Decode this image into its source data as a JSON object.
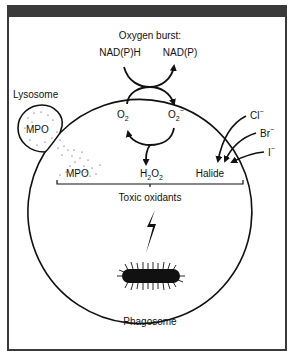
{
  "diagram": {
    "title": "Oxygen burst:",
    "reactants": {
      "nadph": "NAD(P)H",
      "nadp": "NAD(P)",
      "o2": "O",
      "o2_sub": "2",
      "superoxide": "O",
      "superoxide_sub": "2",
      "superoxide_sup": "−"
    },
    "lysosome": {
      "label": "Lysosome",
      "enzyme": "MPO"
    },
    "mpo_released": "MPO",
    "h2o2": {
      "h": "H",
      "sub1": "2",
      "o": "O",
      "sub2": "2"
    },
    "halide": "Halide",
    "halides": [
      {
        "sym": "Cl",
        "sup": "−"
      },
      {
        "sym": "Br",
        "sup": "−"
      },
      {
        "sym": "I",
        "sup": "−"
      }
    ],
    "toxic_oxidants": "Toxic oxidants",
    "phagosome": "Phagosome",
    "colors": {
      "frame": "#3a3a3a",
      "ink": "#111111",
      "background": "#ffffff"
    }
  }
}
